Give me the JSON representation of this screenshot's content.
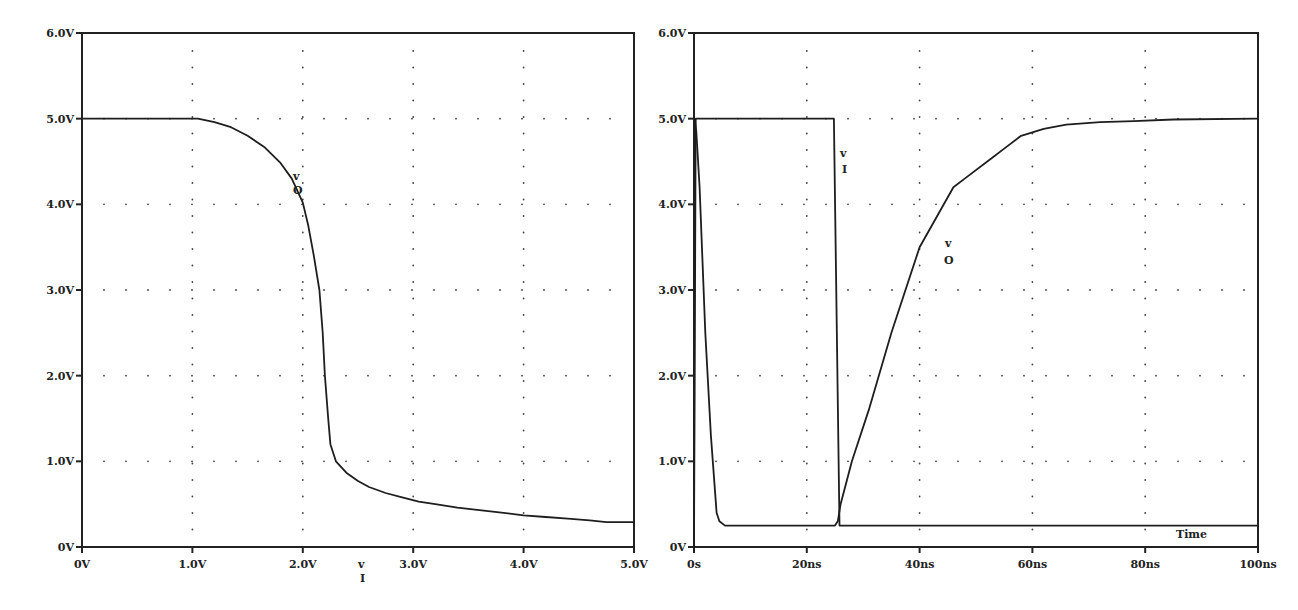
{
  "chart_data": [
    {
      "type": "line",
      "title": "",
      "xlabel": "v_I",
      "ylabel": "",
      "xlim": [
        0,
        5
      ],
      "ylim": [
        0,
        6
      ],
      "grid": "dotted",
      "x_ticks": [
        "0V",
        "1.0V",
        "2.0V",
        "3.0V",
        "4.0V",
        "5.0V"
      ],
      "y_ticks": [
        "0V",
        "1.0V",
        "2.0V",
        "3.0V",
        "4.0V",
        "5.0V",
        "6.0V"
      ],
      "xlabel_main": "v",
      "xlabel_sub": "I",
      "annotations": [
        {
          "text_main": "v",
          "text_sub": "O",
          "x": 1.95,
          "y": 4.3
        }
      ],
      "series": [
        {
          "name": "v_O",
          "x": [
            0,
            1.05,
            1.2,
            1.35,
            1.5,
            1.65,
            1.8,
            1.9,
            2.0,
            2.05,
            2.1,
            2.15,
            2.18,
            2.2,
            2.23,
            2.25,
            2.3,
            2.4,
            2.5,
            2.6,
            2.75,
            2.9,
            3.05,
            3.2,
            3.4,
            3.6,
            3.8,
            4.0,
            4.2,
            4.4,
            4.6,
            4.75,
            5.0
          ],
          "values": [
            5.0,
            5.0,
            4.96,
            4.9,
            4.8,
            4.67,
            4.48,
            4.3,
            4.02,
            3.75,
            3.4,
            3.0,
            2.5,
            2.0,
            1.5,
            1.2,
            1.0,
            0.86,
            0.77,
            0.7,
            0.63,
            0.58,
            0.53,
            0.5,
            0.46,
            0.43,
            0.4,
            0.37,
            0.35,
            0.33,
            0.31,
            0.29,
            0.29
          ]
        }
      ]
    },
    {
      "type": "line",
      "title": "",
      "xlabel": "Time",
      "ylabel": "",
      "xlim": [
        0,
        100
      ],
      "ylim": [
        0,
        6
      ],
      "grid": "dotted",
      "x_ticks": [
        "0s",
        "20ns",
        "40ns",
        "60ns",
        "80ns",
        "100ns"
      ],
      "y_ticks": [
        "0V",
        "1.0V",
        "2.0V",
        "3.0V",
        "4.0V",
        "5.0V",
        "6.0V"
      ],
      "annotations": [
        {
          "text_main": "v",
          "text_sub": "I",
          "x": 27,
          "y": 4.6
        },
        {
          "text_main": "v",
          "text_sub": "O",
          "x": 46,
          "y": 3.5
        }
      ],
      "series": [
        {
          "name": "v_I",
          "x": [
            0,
            0.3,
            24.8,
            25.8,
            100
          ],
          "values": [
            0,
            5.0,
            5.0,
            0.25,
            0.25
          ]
        },
        {
          "name": "v_O",
          "x": [
            0,
            0.1,
            0.4,
            1.0,
            2.0,
            3.0,
            4.0,
            4.5,
            5.5,
            25.0,
            25.5,
            26.0,
            28.0,
            31.0,
            35.0,
            40.0,
            46.0,
            48.0,
            53.0,
            55.0,
            58.0,
            62.0,
            66.0,
            72.0,
            78.0,
            85.0,
            100.0
          ],
          "values": [
            0,
            5.0,
            4.85,
            4.2,
            2.5,
            1.3,
            0.4,
            0.3,
            0.25,
            0.25,
            0.3,
            0.5,
            1.0,
            1.6,
            2.5,
            3.5,
            4.2,
            4.3,
            4.55,
            4.65,
            4.8,
            4.88,
            4.93,
            4.96,
            4.97,
            4.99,
            5.0
          ]
        }
      ]
    }
  ],
  "ui": {
    "left": {
      "y_ticks": [
        "6.0V",
        "5.0V",
        "4.0V",
        "3.0V",
        "2.0V",
        "1.0V",
        "0V"
      ],
      "x_ticks": [
        "0V",
        "1.0V",
        "2.0V",
        "3.0V",
        "4.0V",
        "5.0V"
      ],
      "xlabel_main": "v",
      "xlabel_sub": "I",
      "trace_main": "v",
      "trace_sub": "O"
    },
    "right": {
      "y_ticks": [
        "6.0V",
        "5.0V",
        "4.0V",
        "3.0V",
        "2.0V",
        "1.0V",
        "0V"
      ],
      "x_ticks": [
        "0s",
        "20ns",
        "40ns",
        "60ns",
        "80ns",
        "100ns"
      ],
      "time_label": "Time",
      "vi_main": "v",
      "vi_sub": "I",
      "vo_main": "v",
      "vo_sub": "O"
    }
  }
}
